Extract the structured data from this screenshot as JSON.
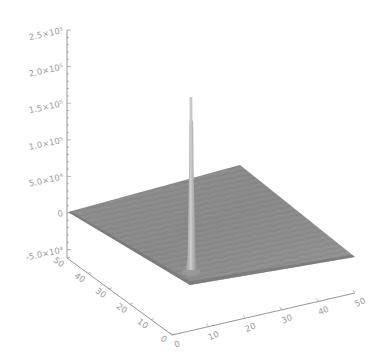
{
  "chart_data": {
    "type": "surface",
    "title": "",
    "xlabel": "",
    "ylabel": "",
    "zlabel": "",
    "x_ticks": [
      "0",
      "10",
      "20",
      "30",
      "40",
      "50"
    ],
    "y_ticks": [
      "0",
      "10",
      "20",
      "30",
      "40",
      "50"
    ],
    "z_ticks": [
      "-5.0×10⁴",
      "0",
      "5.0×10⁴",
      "1.0×10⁵",
      "1.5×10⁵",
      "2.0×10⁵",
      "2.5×10⁵"
    ],
    "xlim": [
      0,
      50
    ],
    "ylim": [
      0,
      50
    ],
    "zlim": [
      -50000,
      250000
    ],
    "grid": false,
    "legend": null,
    "surface": {
      "grid_size": [
        50,
        50
      ],
      "baseline_value": 0,
      "noise_amplitude_approx": 5000,
      "peak": {
        "x": 15,
        "y": 5,
        "z": 160000
      }
    },
    "colors": {
      "surface": "#8c8c8c",
      "surface_dark": "#6f6f6f",
      "surface_light": "#a8a8a8",
      "spike": "#b5b5b5",
      "axes": "#8a8a8a",
      "labels": "#9a9a9a"
    }
  }
}
